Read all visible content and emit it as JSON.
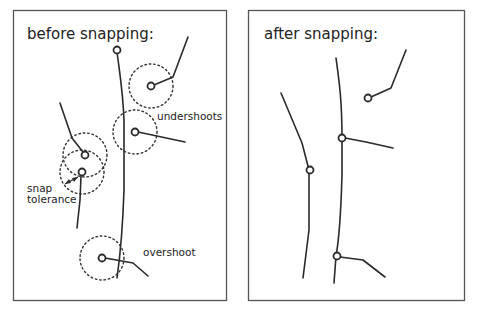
{
  "panels": {
    "before": {
      "title": "before snapping:",
      "labels": {
        "undershoots": "undershoots",
        "snap_tolerance_line1": "snap",
        "snap_tolerance_line2": "tolerance",
        "overshoot": "overshoot"
      }
    },
    "after": {
      "title": "after snapping:"
    }
  },
  "colors": {
    "line": "#2a2a2a",
    "frame": "#555555",
    "background": "#ffffff"
  }
}
